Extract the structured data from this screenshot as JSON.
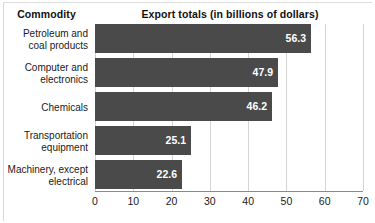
{
  "headers": {
    "commodity": "Commodity",
    "export": "Export totals (in billions of dollars)"
  },
  "colors": {
    "bar": "#4a4a4a",
    "value_text": "#ffffff",
    "gridline": "#d5d5d5",
    "axis": "#8a8a8a",
    "text": "#1a1a1a",
    "background": "#ffffff"
  },
  "chart_data": {
    "type": "bar",
    "orientation": "horizontal",
    "title": "Export totals (in billions of dollars)",
    "xlabel": "",
    "ylabel": "Commodity",
    "xlim": [
      0,
      70
    ],
    "xticks": [
      0,
      10,
      20,
      30,
      40,
      50,
      60,
      70
    ],
    "xtick_labels": [
      "0",
      "10",
      "20",
      "30",
      "40",
      "50",
      "60",
      "70"
    ],
    "grid": true,
    "grid_axis": "x",
    "legend": false,
    "categories": [
      "Petroleum and coal products",
      "Computer and electronics",
      "Chemicals",
      "Transportation equipment",
      "Machinery, except electrical"
    ],
    "category_lines": [
      [
        "Petroleum and",
        "coal products"
      ],
      [
        "Computer and",
        "electronics"
      ],
      [
        "Chemicals"
      ],
      [
        "Transportation",
        "equipment"
      ],
      [
        "Machinery, except",
        "electrical"
      ]
    ],
    "values": [
      56.3,
      47.9,
      46.2,
      25.1,
      22.6
    ],
    "value_labels": [
      "56.3",
      "47.9",
      "46.2",
      "25.1",
      "22.6"
    ]
  }
}
